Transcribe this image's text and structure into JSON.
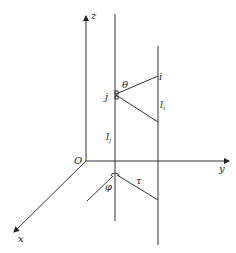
{
  "diagram": {
    "axes": {
      "z_label": "z",
      "y_label": "y",
      "x_label": "x",
      "origin_label": "O"
    },
    "points": {
      "i_label": "i",
      "j_label": "j"
    },
    "lines": {
      "li_label": "l",
      "li_sub": "i",
      "lj_label": "l",
      "lj_sub": "j"
    },
    "angles": {
      "theta_label": "θ",
      "phi_label": "φ",
      "tau_label": "τ"
    },
    "colors": {
      "stroke": "#333333",
      "background": "#ffffff"
    }
  }
}
